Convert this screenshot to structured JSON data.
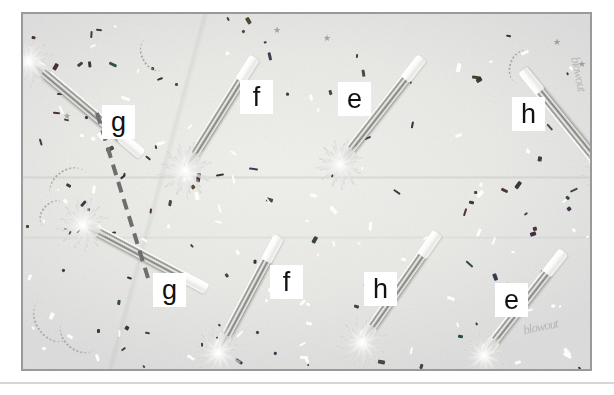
{
  "figure": {
    "kind": "annotated-photograph",
    "caption": "",
    "frame": {
      "x": 21,
      "y": 12,
      "width": 571,
      "height": 359,
      "border_color": "#9a9a9c"
    },
    "background_color": "#ffffff",
    "surface_color": "#eaeae7",
    "separator": {
      "y": 382,
      "color": "#d6d6d6"
    }
  },
  "labels": [
    {
      "id": "label-g-top",
      "text": "g",
      "x": 100,
      "y": 103
    },
    {
      "id": "label-f-top",
      "text": "f",
      "x": 238,
      "y": 78
    },
    {
      "id": "label-e-top",
      "text": "e",
      "x": 336,
      "y": 80
    },
    {
      "id": "label-h-top",
      "text": "h",
      "x": 510,
      "y": 95
    },
    {
      "id": "label-g-bottom",
      "text": "g",
      "x": 151,
      "y": 271
    },
    {
      "id": "label-f-bottom",
      "text": "f",
      "x": 268,
      "y": 263
    },
    {
      "id": "label-h-bottom",
      "text": "h",
      "x": 362,
      "y": 270
    },
    {
      "id": "label-e-bottom",
      "text": "e",
      "x": 493,
      "y": 281
    }
  ],
  "connector": {
    "name": "dashed-correspondence-line",
    "color": "#6e6e6e",
    "width": 4,
    "dash": "11 7",
    "from_label": "label-g-top",
    "to_label": "label-g-bottom",
    "x1": 95,
    "y1": 111,
    "x2": 146,
    "y2": 276
  },
  "objects": [
    {
      "name": "party-blower-1",
      "x": 8,
      "y": 42,
      "angle": 40,
      "length": 145,
      "head": 46
    },
    {
      "name": "party-blower-2",
      "x": 163,
      "y": 148,
      "angle": -58,
      "length": 130,
      "head": 50
    },
    {
      "name": "party-blower-3",
      "x": 318,
      "y": 142,
      "angle": -52,
      "length": 132,
      "head": 44
    },
    {
      "name": "party-blower-4",
      "x": 580,
      "y": 150,
      "angle": -129,
      "length": 128,
      "head": 42
    },
    {
      "name": "party-blower-5",
      "x": 62,
      "y": 205,
      "angle": 28,
      "length": 138,
      "head": 48
    },
    {
      "name": "party-blower-6",
      "x": 196,
      "y": 330,
      "angle": -62,
      "length": 128,
      "head": 46
    },
    {
      "name": "party-blower-7",
      "x": 340,
      "y": 320,
      "angle": -55,
      "length": 130,
      "head": 46
    },
    {
      "name": "party-blower-8",
      "x": 462,
      "y": 333,
      "angle": -52,
      "length": 128,
      "head": 42
    }
  ],
  "annotations": {
    "faint_writing": "blowout"
  }
}
